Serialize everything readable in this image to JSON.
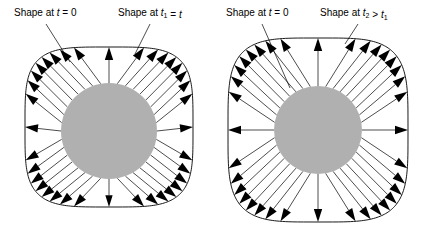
{
  "figure": {
    "type": "diagram",
    "background_color": "#ffffff",
    "line_color": "#000000",
    "shape_fill_color": "#b0b0b0"
  },
  "panels": [
    {
      "id": "left-panel",
      "name": "panel-t1",
      "labels": [
        {
          "id": "left-label-initial",
          "name": "label-shape-at-t-0",
          "prefix": "Shape at ",
          "var": "t",
          "relation": " = 0",
          "sub": "",
          "x": 14,
          "y": 16
        },
        {
          "id": "left-label-later",
          "name": "label-shape-at-t-t1",
          "prefix": "Shape at ",
          "var": "t",
          "relation": " = ",
          "var2": "t",
          "sub": "1",
          "x": 118,
          "y": 16
        }
      ],
      "circle": {
        "cx": 109,
        "cy": 131,
        "r": 48
      },
      "squircle": {
        "cx": 109,
        "cy": 127,
        "rx": 84,
        "ry": 80,
        "corner": 0.46
      },
      "arrow_count": 36
    },
    {
      "id": "right-panel",
      "name": "panel-t2",
      "labels": [
        {
          "id": "right-label-initial",
          "name": "label-shape-at-t-0",
          "prefix": "Shape at ",
          "var": "t",
          "relation": " = 0",
          "sub": "",
          "x": 226,
          "y": 16
        },
        {
          "id": "right-label-later",
          "name": "label-shape-at-t2-gt-t1",
          "prefix": "Shape at ",
          "var": "t",
          "sub": "2",
          "relation": " > ",
          "var2": "t",
          "sub2": "1",
          "x": 320,
          "y": 16
        }
      ],
      "circle": {
        "cx": 318,
        "cy": 130,
        "r": 44
      },
      "squircle": {
        "cx": 318,
        "cy": 130,
        "rx": 90,
        "ry": 92,
        "corner": 0.42
      },
      "arrow_count": 36
    }
  ],
  "leader_lines": [
    {
      "name": "leader-left-initial",
      "x1": 46,
      "y1": 24,
      "x2": 70,
      "y2": 62
    },
    {
      "name": "leader-left-later",
      "x1": 150,
      "y1": 24,
      "x2": 135,
      "y2": 54
    },
    {
      "name": "leader-right-initial",
      "x1": 262,
      "y1": 24,
      "x2": 290,
      "y2": 88
    },
    {
      "name": "leader-right-later",
      "x1": 358,
      "y1": 24,
      "x2": 345,
      "y2": 44
    }
  ]
}
